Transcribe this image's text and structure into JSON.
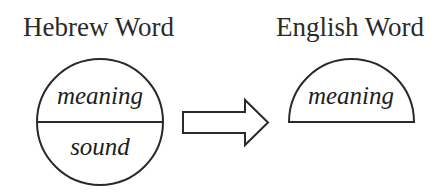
{
  "diagram": {
    "left": {
      "title": "Hebrew Word",
      "shape": "full-circle",
      "top_label": "meaning",
      "bottom_label": "sound"
    },
    "arrow": {
      "direction": "right",
      "style": "outlined-block-arrow"
    },
    "right": {
      "title": "English Word",
      "shape": "half-circle",
      "top_label": "meaning"
    },
    "colors": {
      "stroke": "#2a2a2a",
      "text": "#2a2a2a",
      "background": "#ffffff"
    }
  }
}
